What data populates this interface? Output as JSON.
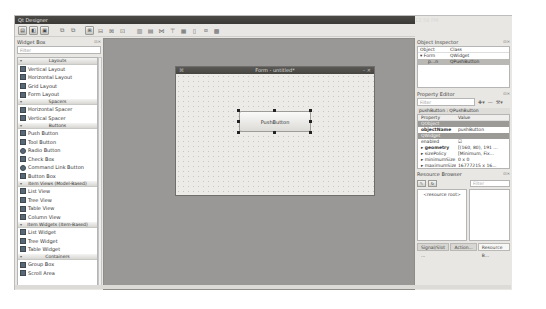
{
  "app": {
    "title": "Qt Designer",
    "clock": "12:58 PM"
  },
  "toolbar": {
    "buttons": [
      "new-form",
      "open-form",
      "save-form",
      "undo",
      "redo",
      "edit-widgets",
      "edit-signals-slots",
      "edit-buddies",
      "edit-tab-order",
      "lay-out-horizontally",
      "lay-out-vertically",
      "lay-out-horizontal-splitter",
      "lay-out-vertical-splitter",
      "lay-out-grid",
      "lay-out-form",
      "break-layout",
      "adjust-size"
    ]
  },
  "widget_box": {
    "title": "Widget Box",
    "filter_placeholder": "Filter",
    "categories": [
      {
        "label": "Layouts",
        "items": [
          "Vertical Layout",
          "Horizontal Layout",
          "Grid Layout",
          "Form Layout"
        ]
      },
      {
        "label": "Spacers",
        "items": [
          "Horizontal Spacer",
          "Vertical Spacer"
        ]
      },
      {
        "label": "Buttons",
        "items": [
          "Push Button",
          "Tool Button",
          "Radio Button",
          "Check Box",
          "Command Link Button",
          "Button Box"
        ]
      },
      {
        "label": "Item Views (Model-Based)",
        "items": [
          "List View",
          "Tree View",
          "Table View",
          "Column View"
        ]
      },
      {
        "label": "Item Widgets (Item-Based)",
        "items": [
          "List Widget",
          "Tree Widget",
          "Table Widget"
        ]
      },
      {
        "label": "Containers",
        "items": [
          "Group Box",
          "Scroll Area"
        ]
      }
    ]
  },
  "form": {
    "title": "Form - untitled*",
    "push_button_label": "PushButton"
  },
  "object_inspector": {
    "title": "Object Inspector",
    "headers": [
      "Object",
      "Class"
    ],
    "rows": [
      {
        "object": "Form",
        "class": "QWidget"
      },
      {
        "object": "p...n",
        "class": "QPushButton"
      }
    ]
  },
  "property_editor": {
    "title": "Property Editor",
    "filter_placeholder": "Filter",
    "subtitle": "pushButton : QPushButton",
    "headers": [
      "Property",
      "Value"
    ],
    "rows": [
      {
        "type": "group",
        "property": "QObject",
        "value": ""
      },
      {
        "type": "bold",
        "property": "objectName",
        "value": "pushButton"
      },
      {
        "type": "group",
        "property": "QWidget",
        "value": ""
      },
      {
        "type": "normal",
        "property": "enabled",
        "value": "☑"
      },
      {
        "type": "bold",
        "property": "▸ geometry",
        "value": "[(160, 80), 191 ..."
      },
      {
        "type": "normal",
        "property": "▸ sizePolicy",
        "value": "[Minimum, Fix..."
      },
      {
        "type": "normal",
        "property": "▸ minimumSize",
        "value": "0 x 0"
      },
      {
        "type": "normal",
        "property": "▸ maximumSize",
        "value": "16777215 x 16..."
      },
      {
        "type": "normal",
        "property": "▸ sizeIncrement",
        "value": "0 x 0"
      }
    ]
  },
  "resource_browser": {
    "title": "Resource Browser",
    "filter_placeholder": "Filter",
    "root_label": "<resource root>"
  },
  "bottom_tabs": [
    "Signal/Slot ...",
    "Action...",
    "Resource B..."
  ],
  "active_bottom_tab": 2
}
